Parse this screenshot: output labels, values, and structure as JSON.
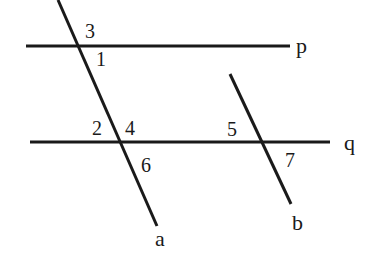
{
  "diagram": {
    "colors": {
      "stroke": "#1a1a1a",
      "background": "#ffffff"
    },
    "lines": {
      "p": {
        "label": "p",
        "x1": 26,
        "y1": 46,
        "x2": 290,
        "y2": 46
      },
      "q": {
        "label": "q",
        "x1": 30,
        "y1": 142,
        "x2": 330,
        "y2": 142
      },
      "a": {
        "label": "a",
        "x1": 58,
        "y1": 0,
        "x2": 157,
        "y2": 226
      },
      "b": {
        "label": "b",
        "x1": 230,
        "y1": 74,
        "x2": 291,
        "y2": 204
      }
    },
    "line_labels": {
      "p": "p",
      "q": "q",
      "a": "a",
      "b": "b"
    },
    "angles": {
      "a1": "1",
      "a2": "2",
      "a3": "3",
      "a4": "4",
      "a5": "5",
      "a6": "6",
      "a7": "7"
    }
  }
}
